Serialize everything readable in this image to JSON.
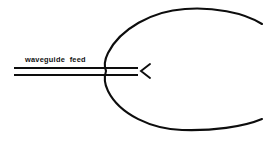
{
  "diagram": {
    "background_color": "#ffffff",
    "ink_color": "#0d0d0d",
    "width": 270,
    "height": 142,
    "labels": {
      "waveguide_feed": "waveguide  feed"
    },
    "shapes": {
      "reflector": {
        "name": "parabolic-reflector-curve",
        "vertex_x": 106,
        "vertex_y": 71,
        "top_end_x": 262,
        "top_end_y": 24,
        "bottom_end_x": 262,
        "bottom_end_y": 119,
        "top_apex_x": 185,
        "top_apex_y": 9,
        "bottom_apex_x": 182,
        "bottom_apex_y": 130,
        "stroke_width": 2.1
      },
      "waveguide": {
        "name": "waveguide-feed-line",
        "left_x": 14,
        "right_x": 138,
        "top_line_y": 68,
        "bottom_line_y": 75,
        "stroke_width": 2.0
      },
      "feed_marker": {
        "name": "feed-horn-chevron",
        "glyph": "<",
        "apex_x": 141,
        "apex_y": 71,
        "top_x": 150,
        "top_y": 64,
        "bottom_x": 150,
        "bottom_y": 78
      }
    },
    "label_positions": {
      "waveguide_feed_x": 25,
      "waveguide_feed_y": 62
    }
  }
}
